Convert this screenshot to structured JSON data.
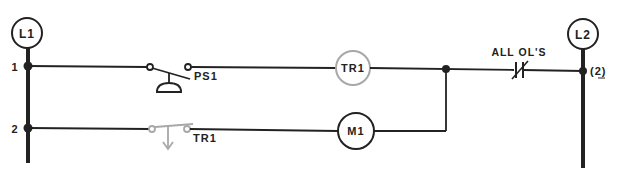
{
  "diagram": {
    "type": "ladder-diagram",
    "rails": {
      "left": {
        "label": "L1"
      },
      "right": {
        "label": "L2"
      }
    },
    "rungs": [
      {
        "number": "1",
        "elements": [
          {
            "type": "pushbutton-switch",
            "label": "PS1"
          },
          {
            "type": "coil",
            "label": "TR1",
            "highlight": "gray"
          },
          {
            "type": "nc-contact",
            "label": "ALL OL'S"
          }
        ],
        "right_marker": "(2)"
      },
      {
        "number": "2",
        "elements": [
          {
            "type": "timed-contact",
            "label": "TR1",
            "highlight": "gray"
          },
          {
            "type": "coil",
            "label": "M1"
          }
        ]
      }
    ],
    "colors": {
      "line": "#222222",
      "highlight": "#a8a8a8"
    }
  }
}
